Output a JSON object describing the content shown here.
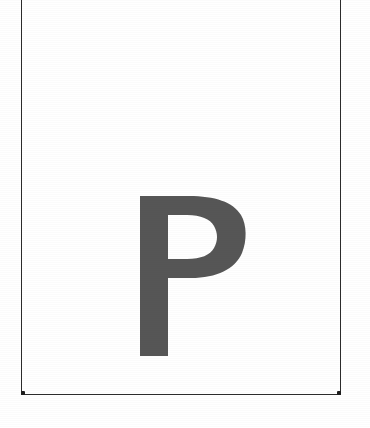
{
  "document": {
    "kind": "scanned-letter-card",
    "background_color": "#ffffff",
    "width": 370,
    "height": 428
  },
  "frame": {
    "name": "card-border",
    "stroke_color": "#2b2b2b",
    "stroke_width": 1.6,
    "left": 21,
    "right": 341,
    "bottom": 395,
    "top_visible": false,
    "note": "top rule cropped at image edge"
  },
  "glyph": {
    "character": "P",
    "label": "letter-p",
    "ink_color": "#565656",
    "typeface_style": "bold-sans-serif",
    "bounds": {
      "left": 140,
      "top": 196,
      "right": 243,
      "bottom": 356,
      "width": 103,
      "height": 160
    },
    "stem_width": 28
  },
  "artifacts": {
    "top_edge_smudge": "faint-gray-residue",
    "texture": "horizontal-scan-lines"
  }
}
